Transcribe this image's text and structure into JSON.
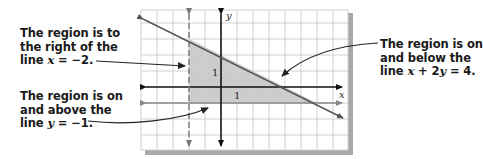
{
  "diagram": {
    "type": "graph-of-system-of-linear-inequalities",
    "axes": {
      "x_label": "x",
      "y_label": "y",
      "x_tick_label": "1",
      "y_tick_label": "1"
    },
    "grid": {
      "x_range": [
        -5,
        8
      ],
      "y_range": [
        -4,
        5
      ],
      "unit": 1
    },
    "boundary_lines": [
      {
        "equation": "x = -2",
        "style": "dashed",
        "color": "#777777"
      },
      {
        "equation": "y = -1",
        "style": "solid",
        "color": "#888888"
      },
      {
        "equation": "x + 2y = 4",
        "style": "solid",
        "color": "#555555"
      }
    ],
    "shaded_region": {
      "vertices": [
        [
          -2,
          3
        ],
        [
          -2,
          -1
        ],
        [
          6,
          -1
        ]
      ],
      "color": "#cccccc"
    },
    "colors": {
      "grid": "#d0d0d0",
      "axes": "#111111",
      "shadow": "#a9a9a9",
      "shade": "#cccccc"
    }
  },
  "annotations": {
    "left": {
      "lines": [
        "The region is to",
        "the right of the"
      ],
      "line3_prefix": "line ",
      "line3_var": "x",
      "line3_suffix": " = −2."
    },
    "bottom": {
      "lines": [
        "The region is on",
        "and above the"
      ],
      "line3_prefix": "line ",
      "line3_var": "y",
      "line3_suffix": " =  −1."
    },
    "right": {
      "lines": [
        "The region is on",
        "and below the"
      ],
      "line3_prefix": "line ",
      "line3_var1": "x",
      "line3_mid": " + 2",
      "line3_var2": "y",
      "line3_suffix": " = 4."
    }
  }
}
